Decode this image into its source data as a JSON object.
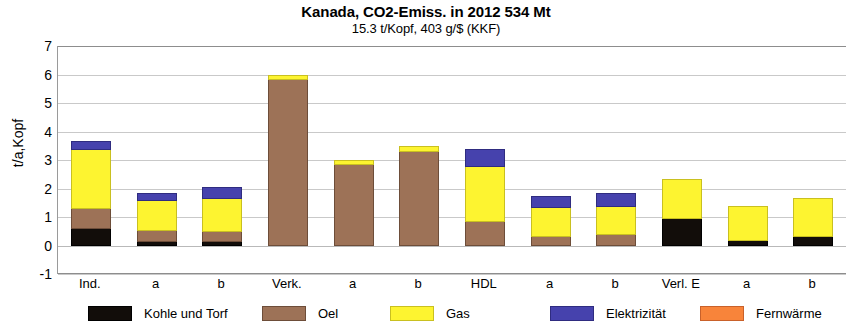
{
  "chart_data": {
    "type": "bar",
    "stacked": true,
    "title": "Kanada, CO2-Emiss. in 2012  534 Mt",
    "subtitle": "15.3  t/Kopf,  403 g/$ (KKF)",
    "xlabel": "",
    "ylabel": "t/a,Kopf",
    "ylim": [
      -1,
      7
    ],
    "yticks": [
      7,
      6,
      5,
      4,
      3,
      2,
      1,
      0,
      -1
    ],
    "grid": true,
    "legend_position": "bottom",
    "categories": [
      "Ind.",
      "a",
      "b",
      "Verk.",
      "a",
      "b",
      "HDL",
      "a",
      "b",
      "Verl. E",
      "a",
      "b"
    ],
    "series": [
      {
        "name": "Kohle und Torf",
        "color": "#120d0a",
        "values": [
          0.6,
          0.15,
          0.15,
          0.0,
          0.0,
          0.0,
          0.0,
          0.0,
          0.0,
          0.95,
          0.2,
          0.35
        ]
      },
      {
        "name": "Oel",
        "color": "#9d7257",
        "values": [
          0.7,
          0.4,
          0.35,
          5.85,
          2.85,
          3.3,
          0.85,
          0.35,
          0.4,
          0.0,
          0.0,
          0.0
        ]
      },
      {
        "name": "Gas",
        "color": "#fdf430",
        "values": [
          2.1,
          1.05,
          1.15,
          0.15,
          0.15,
          0.2,
          1.95,
          1.0,
          1.0,
          1.4,
          1.2,
          1.3
        ]
      },
      {
        "name": "Elektrizität",
        "color": "#4642ad",
        "values": [
          0.25,
          0.25,
          0.4,
          0.0,
          0.0,
          0.0,
          0.6,
          0.4,
          0.45,
          0.0,
          0.0,
          0.0
        ]
      },
      {
        "name": "Fernwärme",
        "color": "#f8843a",
        "values": [
          0.0,
          0.0,
          0.0,
          0.0,
          0.0,
          0.0,
          0.0,
          0.0,
          0.0,
          0.0,
          0.0,
          0.0
        ]
      }
    ],
    "totals": [
      3.65,
      1.85,
      2.05,
      6.0,
      3.0,
      3.5,
      3.4,
      1.75,
      1.85,
      2.35,
      1.4,
      1.65
    ]
  },
  "legend": {
    "items": [
      {
        "label": "Kohle und Torf",
        "swatch": "kohle"
      },
      {
        "label": "Oel",
        "swatch": "oel"
      },
      {
        "label": "Gas",
        "swatch": "gas"
      },
      {
        "label": "Elektrizität",
        "swatch": "elek"
      },
      {
        "label": "Fernwärme",
        "swatch": "fern"
      }
    ]
  }
}
